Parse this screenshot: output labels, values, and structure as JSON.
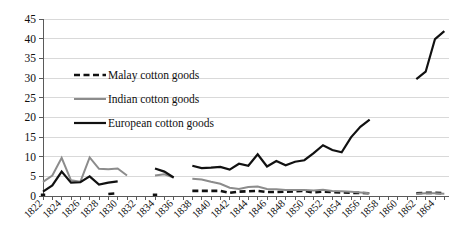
{
  "chart_data": {
    "type": "line",
    "title": "",
    "subtitle": "",
    "xlabel": "",
    "ylabel": "",
    "ylim": [
      0,
      45
    ],
    "ytick_step": 5,
    "yticks": [
      "0",
      "5",
      "10",
      "15",
      "20",
      "25",
      "30",
      "35",
      "40",
      "45"
    ],
    "grid": true,
    "legend_position": "upper-left-inside",
    "x": [
      1822,
      1823,
      1824,
      1825,
      1826,
      1827,
      1828,
      1829,
      1830,
      1831,
      1832,
      1833,
      1834,
      1835,
      1836,
      1837,
      1838,
      1839,
      1840,
      1841,
      1842,
      1843,
      1844,
      1845,
      1846,
      1847,
      1848,
      1849,
      1850,
      1851,
      1852,
      1853,
      1854,
      1855,
      1856,
      1857,
      1858,
      1859,
      1860,
      1861,
      1862,
      1863,
      1864,
      1865
    ],
    "xticks": [
      "1822",
      "1824",
      "1826",
      "1828",
      "1830",
      "1832",
      "1834",
      "1836",
      "1838",
      "1840",
      "1842",
      "1844",
      "1846",
      "1848",
      "1850",
      "1852",
      "1854",
      "1856",
      "1858",
      "1860",
      "1862",
      "1864"
    ],
    "xtick_years": [
      1822,
      1824,
      1826,
      1828,
      1830,
      1832,
      1834,
      1836,
      1838,
      1840,
      1842,
      1844,
      1846,
      1848,
      1850,
      1852,
      1854,
      1856,
      1858,
      1860,
      1862,
      1864
    ],
    "xlim": [
      1822,
      1865.5
    ],
    "series": [
      {
        "name": "Malay cotton goods",
        "key": "malay",
        "color": "#111111",
        "width": 2.6,
        "dash": "6,3.5",
        "values": [
          0.3,
          null,
          null,
          null,
          null,
          null,
          null,
          0.5,
          0.7,
          null,
          null,
          null,
          0.3,
          null,
          null,
          null,
          1.3,
          1.3,
          1.3,
          1.3,
          0.8,
          1.1,
          1.2,
          1.3,
          1.0,
          1.0,
          1.1,
          1.2,
          1.3,
          0.9,
          1.1,
          1.0,
          0.9,
          0.8,
          0.8,
          0.7,
          null,
          null,
          null,
          null,
          0.7,
          0.8,
          0.8,
          0.7
        ]
      },
      {
        "name": "Indian cotton goods",
        "key": "indian",
        "color": "#8c8c8c",
        "width": 2.0,
        "dash": "",
        "values": [
          3.6,
          5.2,
          9.7,
          4.0,
          3.6,
          9.8,
          6.9,
          6.8,
          7.0,
          5.2,
          null,
          null,
          5.2,
          5.5,
          4.7,
          null,
          4.4,
          4.2,
          3.6,
          3.1,
          2.1,
          1.8,
          2.3,
          2.4,
          1.8,
          1.7,
          1.5,
          1.5,
          1.5,
          1.4,
          1.6,
          1.3,
          1.2,
          1.1,
          0.9,
          0.7,
          null,
          null,
          null,
          null,
          0.6,
          0.7,
          0.7,
          0.6
        ]
      },
      {
        "name": "European cotton goods",
        "key": "european",
        "color": "#111111",
        "width": 2.2,
        "dash": "",
        "values": [
          1.1,
          2.7,
          6.2,
          3.4,
          3.5,
          5.0,
          2.9,
          3.4,
          3.7,
          null,
          null,
          null,
          7.0,
          6.2,
          4.7,
          null,
          7.7,
          7.1,
          7.2,
          7.4,
          6.7,
          8.2,
          7.7,
          10.6,
          7.5,
          8.9,
          7.8,
          8.7,
          9.1,
          10.9,
          12.9,
          11.7,
          11.1,
          14.9,
          17.6,
          19.4,
          null,
          null,
          null,
          null,
          29.7,
          31.6,
          39.9,
          41.9
        ]
      }
    ],
    "legend": [
      {
        "label": "Malay cotton goods",
        "color": "#111111",
        "dash": "6,3.5",
        "width": 2.6
      },
      {
        "label": "Indian cotton goods",
        "color": "#8c8c8c",
        "dash": "",
        "width": 2.0
      },
      {
        "label": "European cotton goods",
        "color": "#111111",
        "dash": "",
        "width": 2.2
      }
    ],
    "colors": {
      "gridline": "#d9d9d9",
      "axis": "#5a5a5a",
      "text": "#0f0f0f",
      "background": "#ffffff"
    }
  }
}
